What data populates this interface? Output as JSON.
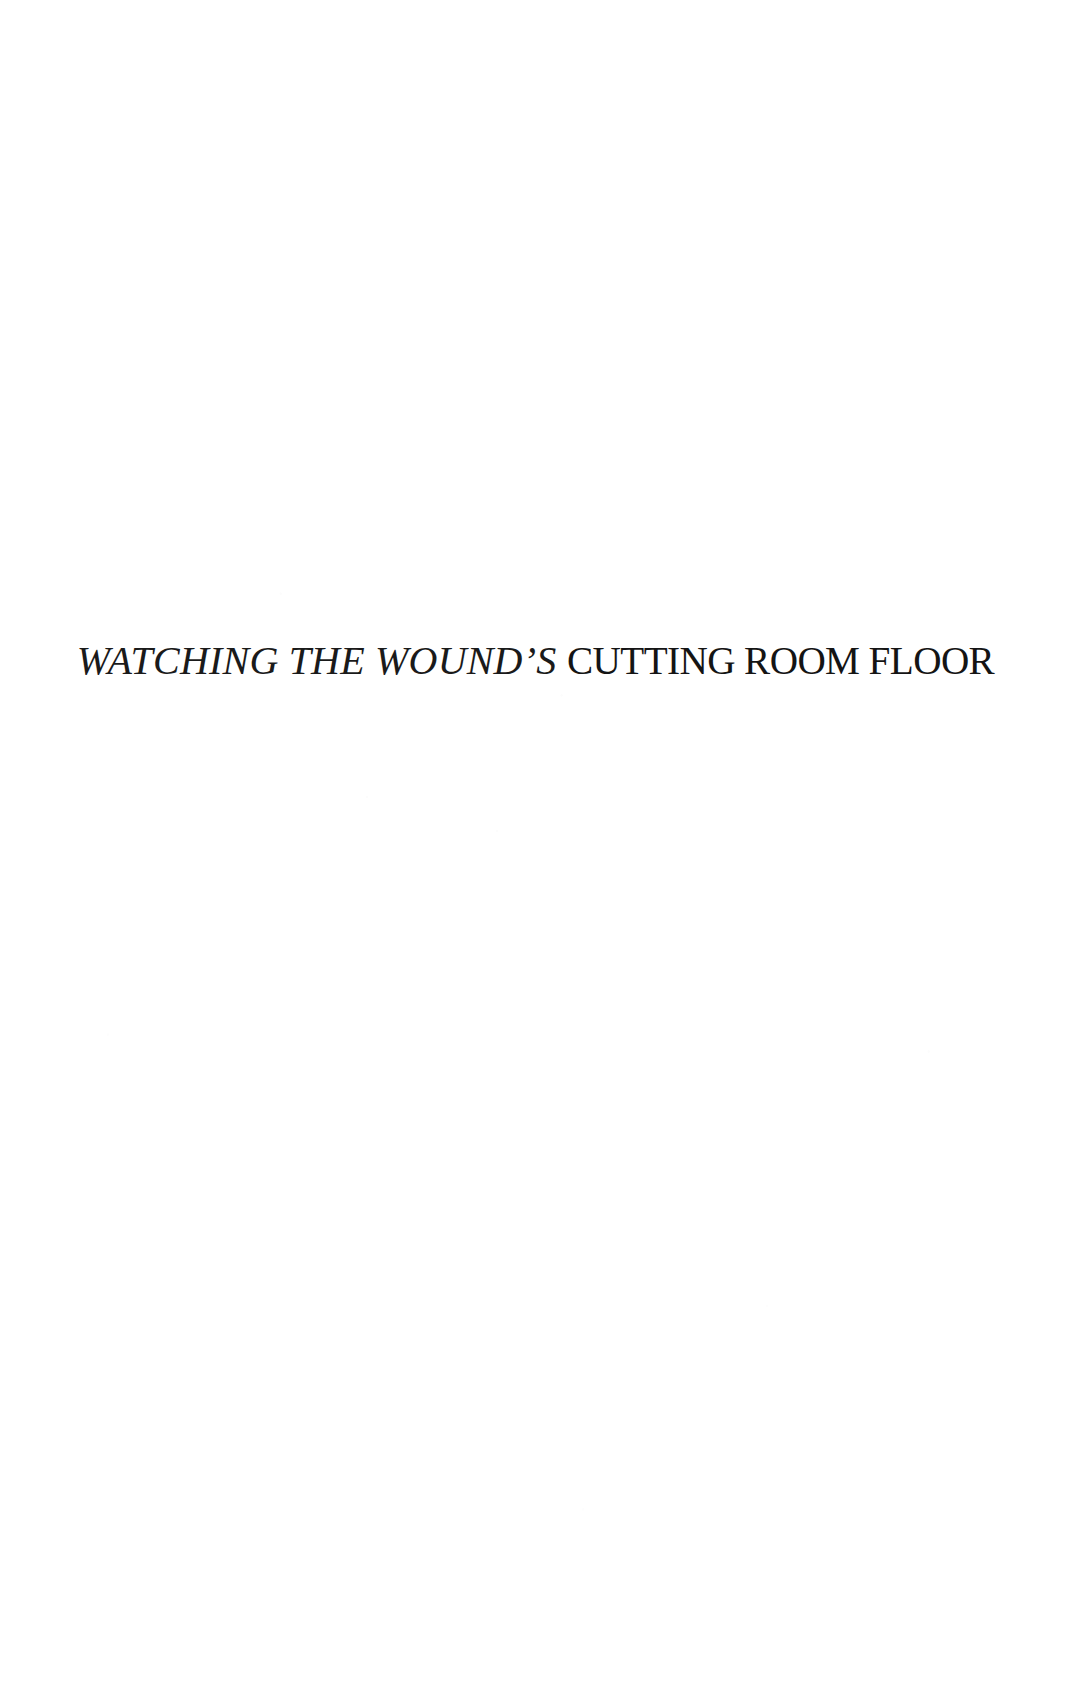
{
  "page": {
    "kind": "scanned-book-page",
    "background_color": "#ffffff",
    "text_color": "#1a1a1a",
    "width": 1080,
    "height": 1696
  },
  "heading": {
    "full_text": "WATCHING THE WOUND’S CUTTING ROOM FLOOR",
    "italic_part": "WATCHING THE WOUND’S",
    "roman_part": "CUTTING ROOM FLOOR",
    "alignment": "center"
  }
}
